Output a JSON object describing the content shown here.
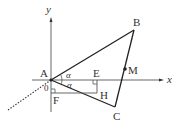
{
  "diagram": {
    "axes": {
      "x_label": "x",
      "y_label": "y",
      "origin_label": "0"
    },
    "points": {
      "A": "A",
      "B": "B",
      "C": "C",
      "M": "M",
      "E": "E",
      "F": "F",
      "H": "H"
    },
    "angles": {
      "upper": "α",
      "lower": "α"
    },
    "colors": {
      "line": "#333333",
      "axis": "#555555"
    }
  }
}
